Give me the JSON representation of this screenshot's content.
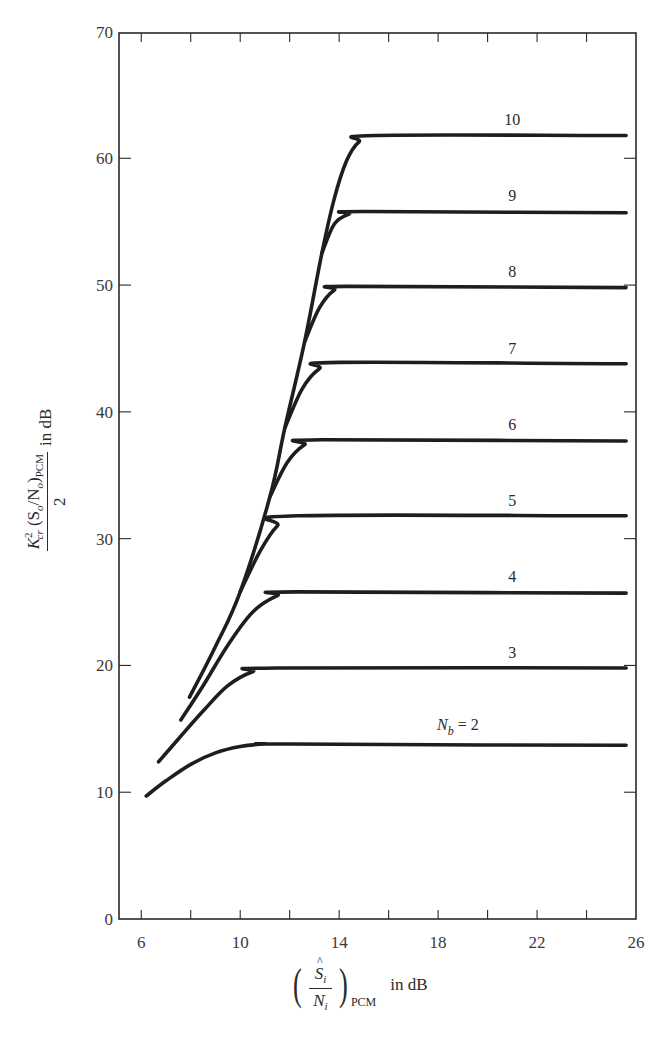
{
  "chart_data": {
    "type": "line",
    "title": "",
    "xlabel": "(Ŝi/Ni)PCM in dB",
    "ylabel": "K²cr (So/No)PCM / 2 in dB",
    "xlim": [
      5.1,
      26
    ],
    "ylim": [
      0,
      70
    ],
    "x_ticks": [
      6,
      10,
      14,
      18,
      22,
      26
    ],
    "x_minor_ticks": [
      8,
      12,
      16,
      20,
      24
    ],
    "y_ticks": [
      0,
      10,
      20,
      30,
      40,
      50,
      60,
      70
    ],
    "grid": false,
    "legend": "inline labels above each curve plateau",
    "parameter": "N_b",
    "series": [
      {
        "name": "N_b = 2",
        "label": "N",
        "label_sub": "b",
        "label_suffix": " = 2",
        "points": [
          [
            6.2,
            9.7
          ],
          [
            7,
            10.9
          ],
          [
            8,
            12.2
          ],
          [
            9,
            13.1
          ],
          [
            10,
            13.6
          ],
          [
            11,
            13.8
          ],
          [
            12,
            13.8
          ],
          [
            25.6,
            13.7
          ]
        ],
        "label_at": [
          18.8,
          14.9
        ]
      },
      {
        "name": "3",
        "label": "3",
        "points": [
          [
            6.7,
            12.4
          ],
          [
            7.5,
            14.2
          ],
          [
            8.5,
            16.4
          ],
          [
            9.5,
            18.4
          ],
          [
            10.5,
            19.5
          ],
          [
            11.5,
            19.8
          ],
          [
            25.6,
            19.8
          ]
        ],
        "label_at": [
          21.0,
          20.6
        ]
      },
      {
        "name": "4",
        "label": "4",
        "points": [
          [
            7.6,
            15.7
          ],
          [
            8.5,
            18.4
          ],
          [
            9.5,
            21.6
          ],
          [
            10.5,
            24.2
          ],
          [
            11.5,
            25.5
          ],
          [
            12.3,
            25.8
          ],
          [
            25.6,
            25.7
          ]
        ],
        "label_at": [
          21.0,
          26.6
        ]
      },
      {
        "name": "5",
        "label": "5",
        "points": [
          [
            10,
            25.8
          ],
          [
            10.8,
            29.0
          ],
          [
            11.5,
            31.0
          ],
          [
            12.3,
            31.8
          ],
          [
            25.6,
            31.8
          ]
        ],
        "label_at": [
          21.0,
          32.6
        ]
      },
      {
        "name": "6",
        "label": "6",
        "points": [
          [
            11.2,
            33.3
          ],
          [
            11.9,
            36.0
          ],
          [
            12.6,
            37.4
          ],
          [
            13.3,
            37.8
          ],
          [
            25.6,
            37.7
          ]
        ],
        "label_at": [
          21.0,
          38.6
        ]
      },
      {
        "name": "7",
        "label": "7",
        "points": [
          [
            11.8,
            38.7
          ],
          [
            12.5,
            41.8
          ],
          [
            13.2,
            43.4
          ],
          [
            14,
            43.9
          ],
          [
            25.6,
            43.8
          ]
        ],
        "label_at": [
          21.0,
          44.6
        ]
      },
      {
        "name": "8",
        "label": "8",
        "points": [
          [
            12.6,
            45.5
          ],
          [
            13.2,
            48.2
          ],
          [
            13.8,
            49.6
          ],
          [
            14.5,
            49.9
          ],
          [
            25.6,
            49.8
          ]
        ],
        "label_at": [
          21.0,
          50.6
        ]
      },
      {
        "name": "9",
        "label": "9",
        "points": [
          [
            13.3,
            52.5
          ],
          [
            13.8,
            54.8
          ],
          [
            14.4,
            55.6
          ],
          [
            15,
            55.8
          ],
          [
            25.6,
            55.7
          ]
        ],
        "label_at": [
          21.0,
          56.6
        ]
      },
      {
        "name": "10",
        "label": "10",
        "points": [
          [
            7.95,
            17.5
          ],
          [
            9,
            21.5
          ],
          [
            10,
            25.8
          ],
          [
            11.2,
            33.3
          ],
          [
            11.8,
            38.7
          ],
          [
            12.6,
            45.5
          ],
          [
            13.3,
            52.5
          ],
          [
            13.8,
            56.8
          ],
          [
            14.3,
            59.8
          ],
          [
            14.8,
            61.3
          ],
          [
            15.5,
            61.8
          ],
          [
            25.6,
            61.8
          ]
        ],
        "label_at": [
          21.0,
          62.6
        ]
      }
    ]
  },
  "axes": {
    "x_tick_labels": [
      "6",
      "10",
      "14",
      "18",
      "22",
      "26"
    ],
    "y_tick_labels": [
      "0",
      "10",
      "20",
      "30",
      "40",
      "50",
      "60",
      "70"
    ],
    "ylabel": {
      "k": "K",
      "k_sup": "2",
      "k_sub": "cr",
      "so": "(S",
      "so_sub": "o",
      "slash": "/N",
      "no_sub": "o",
      "close": ")",
      "pcm_sub": "PCM",
      "den": "2",
      "unit": "in dB"
    },
    "xlabel": {
      "open": "(",
      "s": "S",
      "s_sub": "i",
      "n": "N",
      "n_sub": "i",
      "close": ")",
      "pcm_sub": "PCM",
      "unit": "in dB"
    }
  }
}
